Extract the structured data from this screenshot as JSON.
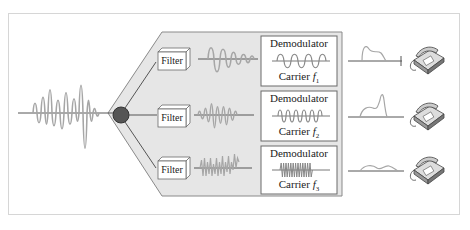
{
  "diagram": {
    "colors": {
      "panel_fill": "#e6e6e6",
      "panel_stroke": "#7a7a7a",
      "wave": "#a6a6a6",
      "node": "#555555",
      "line": "#555555",
      "box_stroke": "#6a6a6a"
    },
    "channels": [
      {
        "filter_label": "Filter",
        "demodulator_label": "Demodulator",
        "carrier_label": "Carrier",
        "carrier_symbol": "f",
        "carrier_index": "1",
        "output_device": "telephone-icon"
      },
      {
        "filter_label": "Filter",
        "demodulator_label": "Demodulator",
        "carrier_label": "Carrier",
        "carrier_symbol": "f",
        "carrier_index": "2",
        "output_device": "telephone-icon"
      },
      {
        "filter_label": "Filter",
        "demodulator_label": "Demodulator",
        "carrier_label": "Carrier",
        "carrier_symbol": "f",
        "carrier_index": "3",
        "output_device": "telephone-icon"
      }
    ]
  }
}
